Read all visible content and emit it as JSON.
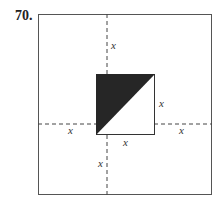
{
  "problem": {
    "number": "70."
  },
  "diagram": {
    "labels": {
      "top": "x",
      "right_side": "x",
      "left": "x",
      "right": "x",
      "bottom_edge": "x",
      "bottom": "x"
    },
    "colors": {
      "shade": "#262626",
      "stroke": "#444444"
    }
  }
}
